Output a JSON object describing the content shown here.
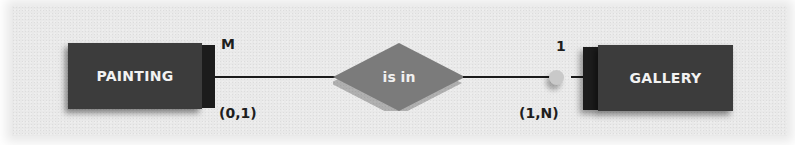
{
  "diagram": {
    "type": "entity-relationship",
    "entities": [
      {
        "name": "PAINTING",
        "side_label_top": "M",
        "cardinality": "(0,1)"
      },
      {
        "name": "GALLERY",
        "side_label_top": "1",
        "cardinality": "(1,N)"
      }
    ],
    "relationship": {
      "label": "is in"
    },
    "colors": {
      "background": "#e9e9e9",
      "entity_fill": "#3c3c3c",
      "entity_side": "#1c1c1c",
      "entity_text": "#f2f2f2",
      "relationship_fill": "#7b7b7b",
      "line": "#1a1a1a",
      "optional_circle": "#c9c9c9"
    }
  }
}
